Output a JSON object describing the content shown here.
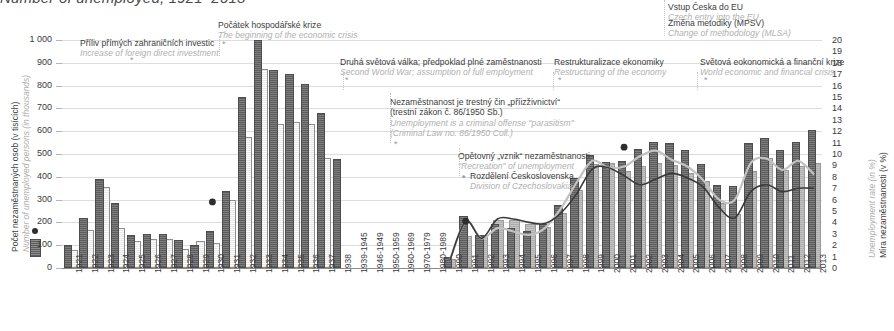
{
  "title": "Number of unemployed, 1921–2013",
  "axes": {
    "left_title_cz": "Počet nezaměstnaných osob (v tisících)",
    "left_title_en": "Number of unemployed persons (in thousands)",
    "right_title_cz": "Míra nezaměstnanosti (v %)",
    "right_title_en": "Unemployment rate (in %)",
    "left_ticks": [
      "1 000",
      "900",
      "800",
      "700",
      "600",
      "500",
      "400",
      "300",
      "200",
      "100",
      "0"
    ],
    "right_ticks": [
      "20",
      "19",
      "18",
      "17",
      "16",
      "15",
      "14",
      "13",
      "12",
      "11",
      "10",
      "9",
      "8",
      "7",
      "6",
      "5",
      "4",
      "3",
      "2",
      "1",
      "0"
    ],
    "left_range": [
      0,
      1000
    ],
    "right_range": [
      0,
      20
    ]
  },
  "legend": {
    "rate_marker": "unemployment-rate-point",
    "bar_marker": "unemployed-persons-bar"
  },
  "annotations": [
    {
      "cz": "Příliv přímých zahraničních investic",
      "en": "Increase of foreign direct investment",
      "year": 1925
    },
    {
      "cz": "Počátek hospodářské krize",
      "en": "The beginning of the economic crisis",
      "year": 1930
    },
    {
      "cz": "Druhá světová válka; předpoklad plné zaměstnanosti",
      "en": "Second World War; assumption of full employment",
      "year": 1939
    },
    {
      "cz": "Nezaměstnanost je trestný čin „příizživnictví“",
      "cz2": "(trestní zákon č. 86/1950 Sb.)",
      "en": "Unemployment is a criminal offense \"parasitism\"",
      "en2": "(Criminal Law no. 86/1950 Coll.)",
      "year": 1950
    },
    {
      "cz": "Opětovný „vznik“ nezaměstnanosti",
      "en": "\"Recreation\" of unemployment",
      "year": 1990
    },
    {
      "cz": "Rozdělení Československa",
      "en": "Division of Czechoslovakia",
      "year": 1993
    },
    {
      "cz": "Restrukturalizace ekonomiky",
      "en": "Restructuring of the economy",
      "year": 1997
    },
    {
      "cz": "Světová eokonomická a finanční krize",
      "en": "World economic and financial crisis",
      "year": 2008
    },
    {
      "cz": "Vstup Česka do EU",
      "en": "Czech entry into the EU",
      "year": 2004
    },
    {
      "cz": "Změna metodiky (MPSV)",
      "en": "Change of methodology (MLSA)",
      "year": 2004
    }
  ],
  "chart_data": {
    "type": "bar",
    "title": "Number of unemployed, 1921–2013",
    "xlabel": "",
    "ylabel": "Number of unemployed persons (in thousands)",
    "ylabel_right": "Unemployment rate (in %)",
    "ylim": [
      0,
      1000
    ],
    "ylim_right": [
      0,
      20
    ],
    "grid": true,
    "legend_position": "left",
    "categories": [
      "1921",
      "1922",
      "1923",
      "1924",
      "1925",
      "1926",
      "1927",
      "1928",
      "1929",
      "1930",
      "1931",
      "1932",
      "1933",
      "1934",
      "1935",
      "1936",
      "1937",
      "1938",
      "1939-1945",
      "1946-1949",
      "1950-1959",
      "1960-1969",
      "1970-1979",
      "1980-1989",
      "1990",
      "1991",
      "1992",
      "1993",
      "1994",
      "1995",
      "1996",
      "1997",
      "1998",
      "1999",
      "2000",
      "2001",
      "2002",
      "2003",
      "2004",
      "2005",
      "2006",
      "2007",
      "2008",
      "2009",
      "2010",
      "2011",
      "2012",
      "2013"
    ],
    "series": [
      {
        "name": "Počet nezaměstnaných osob (v tisících) – A",
        "style": "dark-hatched-bar",
        "color": "#6e6e6e",
        "values": [
          90,
          210,
          380,
          275,
          135,
          140,
          140,
          115,
          90,
          155,
          330,
          740,
          990,
          860,
          840,
          800,
          670,
          470,
          null,
          null,
          null,
          null,
          null,
          null,
          40,
          220,
          135,
          185,
          165,
          155,
          186,
          268,
          387,
          487,
          457,
          461,
          514,
          542,
          541,
          510,
          448,
          354,
          352,
          539,
          561,
          508,
          545,
          596
        ]
      },
      {
        "name": "Počet nezaměstnaných osob (v tisících) – B",
        "style": "light-hatched-bar",
        "color": "#e7e7e7",
        "values": [
          70,
          160,
          345,
          165,
          110,
          120,
          120,
          75,
          110,
          100,
          290,
          565,
          865,
          625,
          630,
          625,
          475,
          null,
          null,
          null,
          null,
          null,
          null,
          null,
          null,
          null,
          null,
          null,
          null,
          null,
          null,
          null,
          null,
          null,
          null,
          null,
          null,
          null,
          null,
          null,
          null,
          null,
          null,
          null,
          null,
          null,
          null,
          null
        ]
      },
      {
        "name": "Registrovaná nezaměstnanost (světlá šedá)",
        "style": "light-grey-bar",
        "color": "#b9b9b9",
        "values": [
          null,
          null,
          null,
          null,
          null,
          null,
          null,
          null,
          null,
          null,
          null,
          null,
          null,
          null,
          null,
          null,
          null,
          null,
          null,
          null,
          null,
          null,
          null,
          null,
          30,
          130,
          135,
          200,
          200,
          185,
          170,
          232,
          332,
          449,
          454,
          418,
          437,
          452,
          441,
          410,
          371,
          276,
          230,
          415,
          475,
          420,
          440,
          450
        ]
      }
    ],
    "lines": [
      {
        "name": "Míra nezaměstnanosti (v %) – obecná",
        "style": "dark-line",
        "color": "#3a3a3a",
        "axis": "right",
        "x": [
          "1990",
          "1991",
          "1992",
          "1993",
          "1994",
          "1995",
          "1996",
          "1997",
          "1998",
          "1999",
          "2000",
          "2001",
          "2002",
          "2003",
          "2004",
          "2005",
          "2006",
          "2007",
          "2008",
          "2009",
          "2010",
          "2011",
          "2012",
          "2013"
        ],
        "values": [
          0.7,
          4.1,
          2.6,
          4.3,
          4.3,
          4.0,
          3.9,
          4.8,
          6.5,
          8.7,
          8.8,
          8.1,
          7.3,
          7.8,
          8.3,
          7.9,
          7.1,
          5.3,
          4.4,
          6.7,
          7.3,
          6.7,
          7.0,
          7.0
        ]
      },
      {
        "name": "Míra registrované nezaměstnanosti (v %)",
        "style": "light-line",
        "color": "#c2c2c2",
        "axis": "right",
        "x": [
          "1990",
          "1991",
          "1992",
          "1993",
          "1994",
          "1995",
          "1996",
          "1997",
          "1998",
          "1999",
          "2000",
          "2001",
          "2002",
          "2003",
          "2004",
          "2005",
          "2006",
          "2007",
          "2008",
          "2009",
          "2010",
          "2011",
          "2012",
          "2013"
        ],
        "values": [
          0.7,
          4.1,
          2.6,
          3.5,
          3.2,
          2.9,
          3.5,
          5.2,
          7.5,
          9.4,
          8.8,
          8.9,
          9.8,
          10.3,
          9.5,
          8.9,
          7.7,
          6.0,
          6.0,
          9.2,
          9.6,
          8.6,
          9.4,
          8.2
        ]
      }
    ],
    "points": [
      {
        "name": "rate-point-1930",
        "x": "1930",
        "value_right_axis": 5.8
      },
      {
        "name": "rate-point-1991",
        "x": "1991",
        "value_right_axis": 4.1
      },
      {
        "name": "rate-point-2001",
        "x": "2001",
        "value_right_axis": 10.6
      }
    ]
  }
}
